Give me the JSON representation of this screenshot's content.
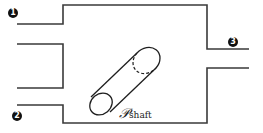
{
  "diagram": {
    "markers": [
      {
        "id": "1",
        "label": "1"
      },
      {
        "id": "2",
        "label": "2"
      },
      {
        "id": "3",
        "label": "3"
      }
    ],
    "shaft_label": {
      "symbol": "𝒫",
      "subscript": "shaft"
    },
    "colors": {
      "wall": "#3a3a3a",
      "marker_bg": "#111111",
      "marker_fg": "#ffffff"
    }
  }
}
